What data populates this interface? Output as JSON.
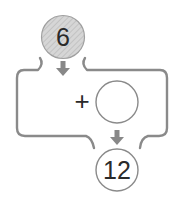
{
  "diagram": {
    "start_value": "6",
    "operator": "+",
    "operand": "",
    "result_value": "12",
    "colors": {
      "stroke": "#8a8a8a",
      "arrow": "#888888",
      "start_fill": "#d2d2d2",
      "hatch": "#bcbcbc",
      "text": "#2a2a2a"
    }
  }
}
